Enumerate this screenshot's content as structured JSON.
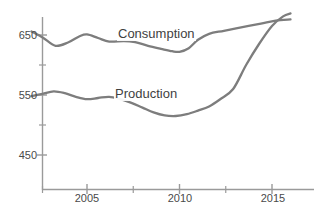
{
  "chart_data": {
    "type": "line",
    "title": "",
    "subtitle": "",
    "xlabel": "",
    "ylabel": "",
    "xlim": [
      2002,
      2016
    ],
    "ylim": [
      420,
      690
    ],
    "grid": false,
    "legend_position": "inline-annotation",
    "x_ticks": [
      2005,
      2010,
      2015
    ],
    "x_tick_labels": [
      "2005",
      "2010",
      "2015"
    ],
    "x_minor_ticks": [
      2007.5,
      2012.5
    ],
    "y_ticks": [
      450,
      550,
      650
    ],
    "y_tick_labels": [
      "450",
      "550",
      "650"
    ],
    "y_minor_ticks": [
      500,
      600
    ],
    "series": [
      {
        "name": "Consumption",
        "color": "#7d7d7d",
        "label_x": 2007.3,
        "label_y": 662,
        "x": [
          2002.0,
          2002.6,
          2003.3,
          2004.0,
          2004.6,
          2005.0,
          2005.6,
          2006.2,
          2007.0,
          2007.6,
          2008.3,
          2009.0,
          2009.6,
          2010.0,
          2010.5,
          2011.0,
          2011.6,
          2012.4,
          2013.4,
          2014.4,
          2015.2,
          2016.0
        ],
        "y": [
          656,
          646,
          632,
          638,
          648,
          651,
          645,
          639,
          640,
          638,
          632,
          627,
          623,
          622,
          628,
          642,
          652,
          657,
          663,
          669,
          674,
          676
        ]
      },
      {
        "name": "Production",
        "color": "#7d7d7d",
        "label_x": 2006.9,
        "label_y": 562,
        "x": [
          2002.0,
          2002.6,
          2003.2,
          2003.8,
          2004.4,
          2005.0,
          2005.6,
          2006.2,
          2006.8,
          2007.4,
          2008.0,
          2008.6,
          2009.2,
          2009.8,
          2010.4,
          2011.0,
          2011.6,
          2012.2,
          2012.9,
          2013.6,
          2014.3,
          2015.0,
          2015.6,
          2016.0
        ],
        "y": [
          548,
          552,
          556,
          553,
          547,
          543,
          545,
          547,
          543,
          537,
          529,
          521,
          516,
          515,
          518,
          524,
          531,
          543,
          560,
          600,
          635,
          665,
          681,
          686
        ]
      }
    ],
    "crossing": {
      "x": 2015.25,
      "y": 675
    }
  },
  "axis": {
    "color": "#9a9a9a",
    "tick_color": "#9a9a9a"
  }
}
